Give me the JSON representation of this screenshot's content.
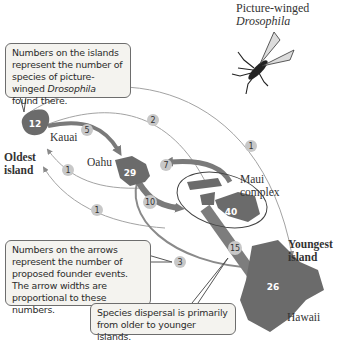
{
  "fly_caption": {
    "line1": "Picture-winged",
    "line2": "Drosophila"
  },
  "callouts": {
    "islands_note": {
      "prefix": "Numbers on the islands represent the number of species of picture-winged ",
      "italic": "Drosophila",
      "suffix": " found there."
    },
    "arrows_note": "Numbers on the arrows represent the number of proposed founder events. The arrow widths are proportional to these numbers.",
    "dispersal_note": "Species dispersal is primarily from older to younger islands."
  },
  "islands": [
    {
      "name": "Kauai",
      "species": "12"
    },
    {
      "name": "Oahu",
      "species": "29"
    },
    {
      "name": "Maui complex",
      "species": "40"
    },
    {
      "name": "Hawaii",
      "species": "26"
    }
  ],
  "labels": {
    "oldest": "Oldest island",
    "oldest_line1": "Oldest",
    "oldest_line2": "island",
    "youngest_line1": "Youngest",
    "youngest_line2": "island",
    "kauai": "Kauai",
    "oahu": "Oahu",
    "maui_line1": "Maui",
    "maui_line2": "complex",
    "hawaii": "Hawaii"
  },
  "arrows": [
    {
      "from": "Kauai",
      "to": "Oahu",
      "events": "5"
    },
    {
      "from": "Kauai",
      "to": "Maui complex",
      "events": "2"
    },
    {
      "from": "Kauai",
      "to": "Hawaii",
      "events": "1"
    },
    {
      "from": "Oahu",
      "to": "Kauai",
      "events": "1"
    },
    {
      "from": "Maui complex",
      "to": "Kauai",
      "events": "1"
    },
    {
      "from": "Maui complex",
      "to": "Oahu",
      "events": "7"
    },
    {
      "from": "Oahu",
      "to": "Maui complex",
      "events": "10"
    },
    {
      "from": "Oahu",
      "to": "Hawaii",
      "events": "3"
    },
    {
      "from": "Maui complex",
      "to": "Hawaii",
      "events": "15"
    }
  ],
  "colors": {
    "island": "#6b6b6b",
    "arrow_thick": "#7a7a7a",
    "arrow_thin": "#9a9a9a",
    "badge": "#c8c8c8",
    "callout_bg": "#f4f3ef"
  }
}
